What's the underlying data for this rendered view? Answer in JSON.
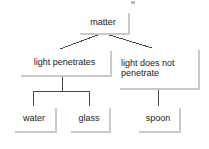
{
  "diagram": {
    "type": "tree",
    "background_color": "#ffffff",
    "node_fill": "#ffffff",
    "node_border_color": "#3a3a3a",
    "shadow_color": "#c9c9c9",
    "connector_color": "#4a4a4a",
    "nodes": [
      {
        "id": "matter",
        "label": "matter",
        "level": 0
      },
      {
        "id": "penetrates",
        "label": "light penetrates",
        "level": 1
      },
      {
        "id": "no_penetrate",
        "label": "light does not\npenetrate",
        "level": 1
      },
      {
        "id": "water",
        "label": "water",
        "level": 2
      },
      {
        "id": "glass",
        "label": "glass",
        "level": 2
      },
      {
        "id": "spoon",
        "label": "spoon",
        "level": 2
      }
    ],
    "edges": [
      {
        "from": "matter",
        "to": "penetrates",
        "style": "diagonal"
      },
      {
        "from": "matter",
        "to": "no_penetrate",
        "style": "diagonal"
      },
      {
        "from": "penetrates",
        "to": "water",
        "style": "elbow"
      },
      {
        "from": "penetrates",
        "to": "glass",
        "style": "elbow"
      },
      {
        "from": "no_penetrate",
        "to": "spoon",
        "style": "straight"
      }
    ]
  }
}
